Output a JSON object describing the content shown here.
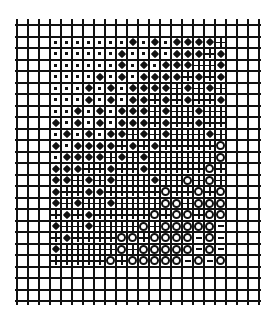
{
  "figure": {
    "type": "symbol-grid",
    "cols": 22,
    "rows": 24,
    "cell_width": 11,
    "cell_height": 11.5,
    "line_color": "#111111",
    "legend_symbols": {
      "s": "small-square",
      "D": "filled-diamond",
      "+": "plus",
      "o": "open-circle",
      "-": "dash",
      ".": "empty"
    },
    "grid_rows": [
      "......................",
      "...sssssssDsDsDDDD+...",
      "...ssssssDssDsDDD+D...",
      "...ssssssDsDsDDD++D...",
      "...ssssDsDsDDDD+D+D...",
      "...sssDsDsDDDD+D+D+...",
      "...sssDsDsDD+D+D++D...",
      "...ssDsDsDDD+D++D++...",
      "...DsDsDsDDD+D++D++...",
      "...sDsDsDD+D+D+++D+...",
      "...DsDDDD+D+D+++++o...",
      "...sDDDD+D+D++++++o...",
      "...DDD++D++D+++++o+...",
      "...DD+D+D+++D++o+o+...",
      "...D++DD+++++o++o+o...",
      "...D+D++D++++oo+ooo...",
      "...+D+D+++++o+oo+oo...",
      "...D++D++++o+ooooo-...",
      "...+D++++oo+oooo-o-...",
      "...D+++++o+ooooo-o-...",
      "...+++++o+ooooo-o-o...",
      "......................",
      "......................",
      "......................"
    ]
  }
}
